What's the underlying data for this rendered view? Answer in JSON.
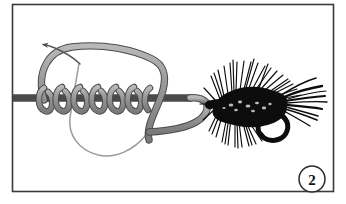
{
  "figure": {
    "step_number": "2",
    "frame": {
      "border_color": "#3a3a3a",
      "background_color": "#ffffff",
      "x": 12,
      "y": 4,
      "width": 322,
      "height": 188
    },
    "colors": {
      "line_fill": "#8c8c8c",
      "line_stroke": "#4a4a4a",
      "tag_line": "#8c8c8c",
      "fly_black": "#0d0d0d",
      "badge_stroke": "#2b2b2b",
      "badge_text": "#111111"
    },
    "elements": {
      "standing_line_label": "standing line",
      "coil_wraps_count": 6,
      "loop_label": "open loop",
      "tag_end_label": "tag end",
      "arrow_label": "pull direction arrow",
      "fly_label": "black woolly bugger fly",
      "hook_label": "hook bend and point",
      "hook_eye_label": "hook eye"
    },
    "badge": {
      "center_x": 312,
      "center_y": 179,
      "radius": 13,
      "label": "2"
    }
  }
}
